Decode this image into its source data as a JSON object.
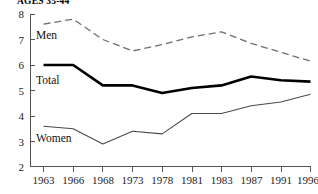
{
  "chart_data": {
    "type": "line",
    "title": "AGES 35-44",
    "xlabel": "",
    "ylabel": "",
    "x": [
      "1963",
      "1966",
      "1968",
      "1973",
      "1978",
      "1981",
      "1983",
      "1987",
      "1991",
      "1996"
    ],
    "categories": [
      "1963",
      "1966",
      "1968",
      "1973",
      "1978",
      "1981",
      "1983",
      "1987",
      "1991",
      "1996"
    ],
    "ylim": [
      2,
      8
    ],
    "yticks": [
      "8",
      "7",
      "6",
      "5",
      "4",
      "3",
      "2"
    ],
    "grid": false,
    "legend_position": "inline-labels",
    "series": [
      {
        "name": "Men",
        "style": "dashed",
        "color": "#6e6e6e",
        "values": [
          7.6,
          7.8,
          7.0,
          6.55,
          6.8,
          7.1,
          7.3,
          6.85,
          6.5,
          6.15
        ]
      },
      {
        "name": "Total",
        "style": "solid-thick",
        "color": "#000000",
        "values": [
          6.0,
          6.0,
          5.2,
          5.2,
          4.9,
          5.1,
          5.2,
          5.55,
          5.4,
          5.35
        ]
      },
      {
        "name": "Women",
        "style": "solid-thin",
        "color": "#4a4a4a",
        "values": [
          3.6,
          3.5,
          2.9,
          3.4,
          3.3,
          4.1,
          4.1,
          4.4,
          4.55,
          4.85
        ]
      }
    ],
    "annotations": [
      {
        "text": "Men",
        "series": "Men"
      },
      {
        "text": "Total",
        "series": "Total"
      },
      {
        "text": "Women",
        "series": "Women"
      }
    ]
  }
}
